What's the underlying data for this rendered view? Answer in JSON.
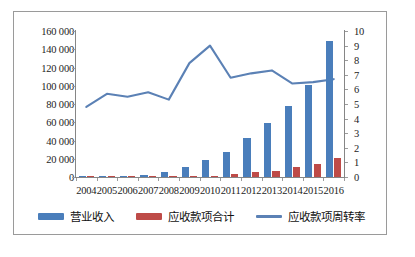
{
  "chart_data": {
    "type": "bar",
    "title": "",
    "xlabel": "",
    "ylabel": "",
    "categories": [
      "2004",
      "2005",
      "2006",
      "2007",
      "2008",
      "2009",
      "2010",
      "2011",
      "2012",
      "2013",
      "2014",
      "2015",
      "2016"
    ],
    "grid": false,
    "legend_position": "bottom",
    "axes": {
      "left": {
        "min": 0,
        "max": 160000,
        "step": 20000,
        "ticks": [
          "0",
          "20 000",
          "40 000",
          "60 000",
          "80 000",
          "100 000",
          "120 000",
          "140 000",
          "160 000"
        ],
        "tick_values": [
          0,
          20000,
          40000,
          60000,
          80000,
          100000,
          120000,
          140000,
          160000
        ]
      },
      "right": {
        "min": 0,
        "max": 10,
        "step": 1,
        "ticks": [
          "0",
          "1",
          "2",
          "3",
          "4",
          "5",
          "6",
          "7",
          "8",
          "9",
          "10"
        ],
        "tick_values": [
          0,
          1,
          2,
          3,
          4,
          5,
          6,
          7,
          8,
          9,
          10
        ]
      }
    },
    "series": [
      {
        "name": "营业收入",
        "type": "bar",
        "axis": "left",
        "color": "#4a7ebb",
        "values": [
          300,
          500,
          1300,
          2200,
          5800,
          11500,
          18700,
          27700,
          42500,
          59000,
          77500,
          101000,
          149000
        ]
      },
      {
        "name": "应收款项合计",
        "type": "bar",
        "axis": "left",
        "color": "#be4b48",
        "values": [
          100,
          200,
          300,
          400,
          900,
          1300,
          1500,
          2900,
          5200,
          7000,
          11200,
          14500,
          21000
        ]
      },
      {
        "name": "应收款项周转率",
        "type": "line",
        "axis": "right",
        "color": "#5b81b5",
        "values": [
          4.8,
          5.7,
          5.5,
          5.8,
          5.3,
          7.8,
          9.0,
          6.8,
          7.1,
          7.3,
          6.4,
          6.5,
          6.7
        ]
      }
    ]
  },
  "legend": {
    "items": [
      {
        "label": "营业收入",
        "color": "#4a7ebb",
        "marker": "bar"
      },
      {
        "label": "应收款项合计",
        "color": "#be4b48",
        "marker": "bar"
      },
      {
        "label": "应收款项周转率",
        "color": "#5b81b5",
        "marker": "line"
      }
    ]
  },
  "colors": {
    "revenue_bar": "#4a7ebb",
    "receivables_bar": "#be4b48",
    "turnover_line": "#5b81b5",
    "frame_border": "#9a9a9a",
    "axis": "#868686",
    "text": "#1c1c1c"
  }
}
